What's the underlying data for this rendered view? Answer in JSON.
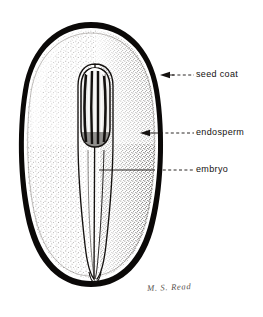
{
  "figure": {
    "kind": "botanical-line-drawing",
    "background_color": "#ffffff",
    "ink_color": "#14110f",
    "width": 263,
    "height": 317
  },
  "labels": [
    {
      "id": "seed-coat",
      "text": "seed coat",
      "leader": "dashed",
      "arrow": "left",
      "points_to": "outer black seed coat band"
    },
    {
      "id": "endosperm",
      "text": "endosperm",
      "leader": "dashed",
      "arrow": "left",
      "points_to": "stippled endosperm tissue"
    },
    {
      "id": "embryo",
      "text": "embryo",
      "leader": "solid-then-dashed",
      "arrow": "none",
      "points_to": "central embryo body"
    }
  ],
  "signature": {
    "text": "M. S. Read"
  }
}
